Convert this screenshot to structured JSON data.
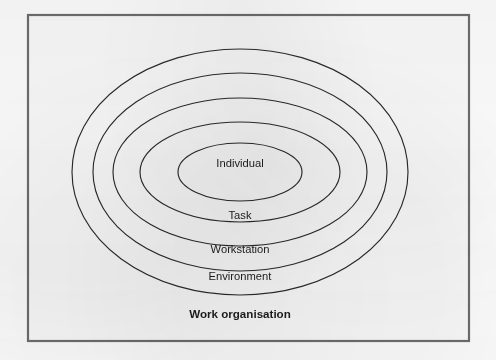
{
  "figure": {
    "background_color": "#fdfdfd",
    "frame": {
      "name": "diagram-border-frame",
      "stroke_color": "#6d6d6d",
      "fill_color": "#fafafa",
      "x": 28,
      "y": 15,
      "width": 441,
      "height": 326
    },
    "ellipse_stroke_color": "#2b2b2b",
    "label_color": "#1d1d1d",
    "center": {
      "cx": 240,
      "cy": 172
    },
    "rings": [
      {
        "label": "Individual",
        "level": 1,
        "rx": 62,
        "ry": 29,
        "label_x": 240,
        "label_y": 164,
        "bold": false
      },
      {
        "label": "Task",
        "level": 2,
        "rx": 100,
        "ry": 50,
        "label_x": 240,
        "label_y": 216,
        "bold": false
      },
      {
        "label": "Workstation",
        "level": 3,
        "rx": 127,
        "ry": 74,
        "label_x": 240,
        "label_y": 250,
        "bold": false
      },
      {
        "label": "Environment",
        "level": 4,
        "rx": 147,
        "ry": 99,
        "label_x": 240,
        "label_y": 277,
        "bold": false
      },
      {
        "label": "Work organisation",
        "level": 5,
        "rx": 168,
        "ry": 123,
        "label_x": 240,
        "label_y": 315,
        "bold": true
      }
    ]
  },
  "chart_data": {
    "type": "diagram",
    "subtype": "concentric-ellipses",
    "title": "",
    "categories": [
      "Individual",
      "Task",
      "Workstation",
      "Environment",
      "Work organisation"
    ],
    "values": [
      1,
      2,
      3,
      4,
      5
    ],
    "legend": "none",
    "grid": false
  }
}
